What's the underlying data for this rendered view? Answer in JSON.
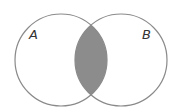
{
  "diagram": {
    "type": "venn",
    "sets": [
      {
        "label": "A",
        "cx": 61,
        "cy": 60,
        "r": 46
      },
      {
        "label": "B",
        "cx": 121,
        "cy": 60,
        "r": 46
      }
    ],
    "shaded_region": "A ∩ B",
    "colors": {
      "stroke": "#8a8a8a",
      "fill": "#8c8c8c",
      "background": "#ffffff"
    }
  }
}
